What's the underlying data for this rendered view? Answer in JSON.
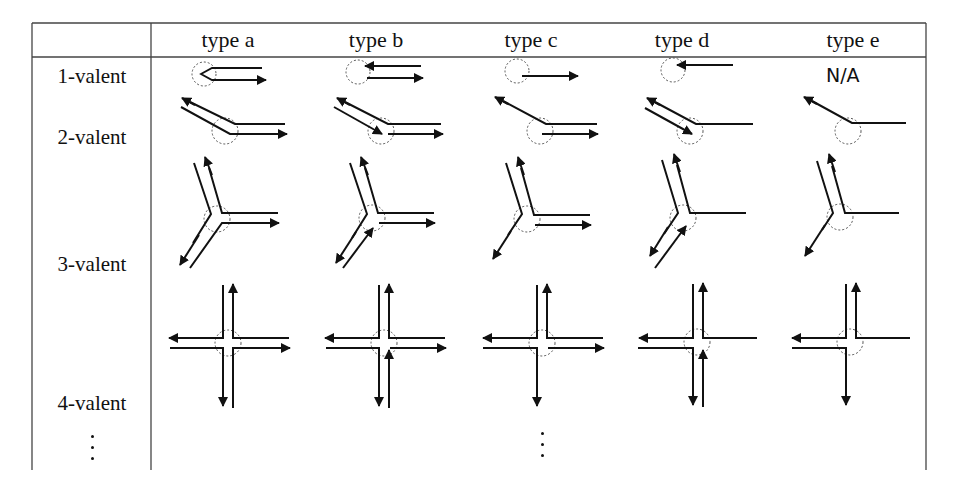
{
  "table": {
    "columns": [
      {
        "label": "type a",
        "cx": 228
      },
      {
        "label": "type b",
        "cx": 384
      },
      {
        "label": "type c",
        "cx": 540
      },
      {
        "label": "type d",
        "cx": 690
      },
      {
        "label": "type e",
        "cx": 845
      }
    ],
    "rows": [
      {
        "label": "1-valent",
        "label_y": 64
      },
      {
        "label": "2-valent",
        "label_y": 125
      },
      {
        "label": "3-valent",
        "label_y": 252
      },
      {
        "label": "4-valent",
        "label_y": 391
      }
    ],
    "na_label": "N/A",
    "continuation": "⋮"
  },
  "colors": {
    "stroke": "#111111",
    "grid": "#444444",
    "circle": "#555555"
  }
}
